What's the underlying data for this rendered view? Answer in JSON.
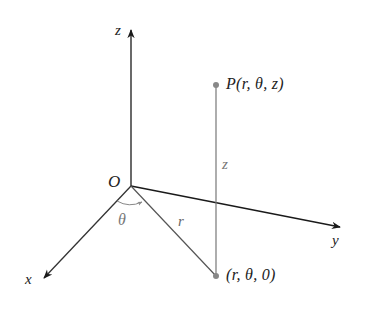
{
  "diagram": {
    "axes": {
      "z": {
        "label": "z",
        "from": [
          131,
          186
        ],
        "to": [
          131,
          28
        ]
      },
      "y": {
        "label": "y",
        "from": [
          131,
          186
        ],
        "to": [
          342,
          227
        ]
      },
      "x": {
        "label": "x",
        "from": [
          131,
          186
        ],
        "to": [
          42,
          280
        ]
      }
    },
    "origin_label": "O",
    "point_P": {
      "label": "P(r, θ, z)",
      "pos": [
        216,
        85
      ]
    },
    "point_proj": {
      "label": "(r, θ, 0)",
      "pos": [
        216,
        276
      ]
    },
    "segment_labels": {
      "height": "z",
      "radius": "r",
      "angle": "θ"
    },
    "colors": {
      "axis": "#1a1a1a",
      "guide": "#777777",
      "point": "#888888",
      "text": "#222222",
      "gray_text": "#777777"
    }
  }
}
